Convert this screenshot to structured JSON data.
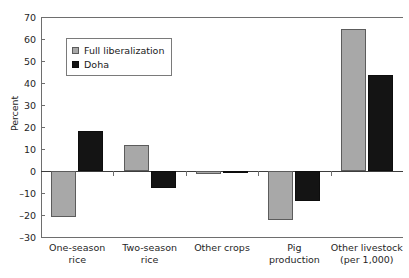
{
  "chart_data": {
    "type": "bar",
    "title": "",
    "xlabel": "",
    "ylabel": "Percent",
    "ylim": [
      -30,
      70
    ],
    "yticks": [
      70,
      60,
      50,
      40,
      30,
      20,
      10,
      0,
      -10,
      -20,
      -30
    ],
    "ytick_labels": [
      "70",
      "60",
      "50",
      "40",
      "30",
      "20",
      "10",
      "0",
      "–10",
      "–20",
      "–30"
    ],
    "grid": false,
    "legend_position": "upper-left-inside",
    "categories": [
      "One-season rice",
      "Two-season rice",
      "Other crops",
      "Pig production",
      "Other livestock (per 1,000)"
    ],
    "category_lines": [
      [
        "One-season",
        "rice"
      ],
      [
        "Two-season",
        "rice"
      ],
      [
        "Other crops",
        ""
      ],
      [
        "Pig",
        "production"
      ],
      [
        "Other livestock",
        "(per 1,000)"
      ]
    ],
    "series": [
      {
        "name": "Full liberalization",
        "color": "#a8a8a8",
        "values": [
          -20.9,
          11.8,
          -1.2,
          -22.3,
          64.5
        ]
      },
      {
        "name": "Doha",
        "color": "#141414",
        "values": [
          18.2,
          -7.7,
          -0.5,
          -13.5,
          43.6
        ]
      }
    ]
  },
  "legend": {
    "items": [
      {
        "label": "Full liberalization",
        "swatch": "full-lib"
      },
      {
        "label": "Doha",
        "swatch": "doha"
      }
    ]
  }
}
